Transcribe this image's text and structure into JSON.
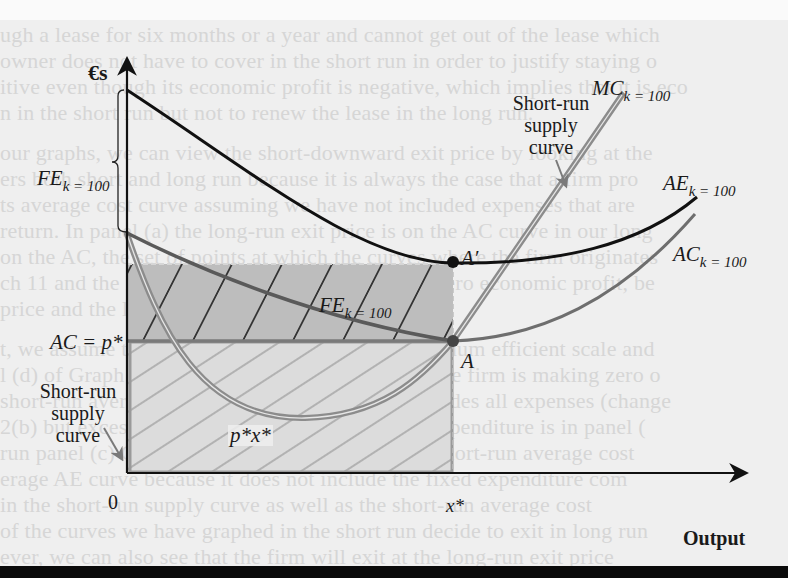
{
  "figure": {
    "y_axis_label": "€s",
    "x_axis_label": "Output",
    "origin_label": "0",
    "x_star_label": "x*",
    "price_label": "AC = p*",
    "revenue_area_label": "p*x*",
    "points": {
      "A": "A",
      "A_prime": "A′"
    },
    "curves": {
      "MC": {
        "name": "MC",
        "subscript": "k = 100",
        "color": "#8c8c8c"
      },
      "AE": {
        "name": "AE",
        "subscript": "k = 100",
        "color": "#111111"
      },
      "AC": {
        "name": "AC",
        "subscript": "k = 100",
        "color": "#6e6e6e"
      },
      "FE": {
        "name": "FE",
        "subscript": "k = 100",
        "color": "#5a5a5a"
      }
    },
    "brace_label": {
      "name": "FE",
      "subscript": "k = 100"
    },
    "annotations": {
      "supply_right": [
        "Short-run",
        "supply",
        "curve"
      ],
      "supply_left": [
        "Short-run",
        "supply",
        "curve"
      ]
    },
    "colors": {
      "fixed_expenditure_area": "#bdbdbd",
      "revenue_area": "#dcdcdc",
      "axis": "#111111"
    }
  }
}
